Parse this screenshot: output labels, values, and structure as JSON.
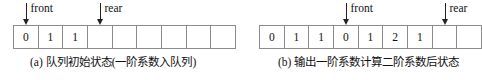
{
  "figure": {
    "panels": [
      {
        "id": "a",
        "caption": "(a) 队列初始状态(一阶系数入队列)",
        "cells": [
          "0",
          "1",
          "1",
          "",
          "",
          "",
          "",
          "",
          ""
        ],
        "pointers": [
          {
            "label": "front",
            "cell_index": 0
          },
          {
            "label": "rear",
            "cell_index": 3
          }
        ]
      },
      {
        "id": "b",
        "caption": "(b) 输出一阶系数计算二阶系数后状态",
        "cells": [
          "0",
          "1",
          "1",
          "0",
          "1",
          "2",
          "1",
          "",
          ""
        ],
        "pointers": [
          {
            "label": "front",
            "cell_index": 3
          },
          {
            "label": "rear",
            "cell_index": 7
          }
        ]
      }
    ],
    "colors": {
      "cell_border": "#8c8c8c",
      "arrow": "#222222",
      "text": "#111111",
      "background": "#ffffff"
    }
  }
}
